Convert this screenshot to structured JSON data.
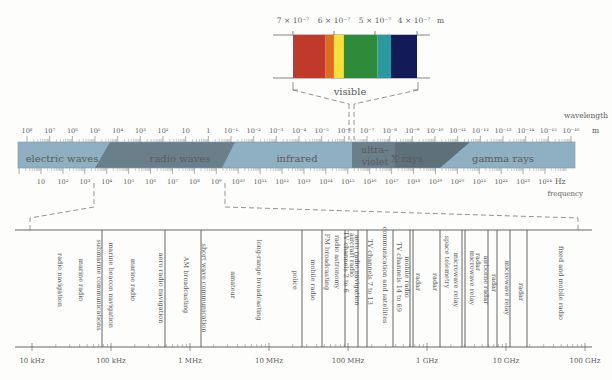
{
  "visible": {
    "title": "visible",
    "wavelength_labels": [
      "7 × 10⁻⁷",
      "6 × 10⁻⁷",
      "5 × 10⁻⁷",
      "4 × 10⁻⁷"
    ],
    "unit": "m",
    "bands": [
      {
        "name": "red",
        "color": "#c0392b",
        "span": 0.26
      },
      {
        "name": "orange",
        "color": "#e06a1e",
        "span": 0.07
      },
      {
        "name": "yellow",
        "color": "#f2e23a",
        "span": 0.08
      },
      {
        "name": "green",
        "color": "#2e8b3a",
        "span": 0.27
      },
      {
        "name": "blue-green",
        "color": "#2a9aa0",
        "span": 0.11
      },
      {
        "name": "violet",
        "color": "#121a58",
        "span": 0.21
      }
    ]
  },
  "spectrum": {
    "wavelength_title": "wavelength",
    "wavelength_unit": "m",
    "wavelength_labels": [
      "10⁸",
      "10⁷",
      "10⁶",
      "10⁵",
      "10⁴",
      "10³",
      "10²",
      "10",
      "1",
      "10⁻¹",
      "10⁻²",
      "10⁻³",
      "10⁻⁴",
      "10⁻⁵",
      "10⁻⁶",
      "10⁻⁷",
      "10⁻⁸",
      "10⁻⁹",
      "10⁻¹⁰",
      "10⁻¹¹",
      "10⁻¹²",
      "10⁻¹³",
      "10⁻¹⁴",
      "10⁻¹⁵",
      "10⁻¹⁶"
    ],
    "frequency_title": "frequency",
    "frequency_unit": "Hz",
    "frequency_labels": [
      "10",
      "10²",
      "10³",
      "10⁴",
      "10⁵",
      "10⁶",
      "10⁷",
      "10⁸",
      "10⁹",
      "10¹⁰",
      "10¹¹",
      "10¹²",
      "10¹³",
      "10¹⁴",
      "10¹⁵",
      "10¹⁶",
      "10¹⁷",
      "10¹⁸",
      "10¹⁹",
      "10²⁰",
      "10²¹",
      "10²²",
      "10²³",
      "10²⁴"
    ],
    "regions": [
      {
        "label": "electric waves"
      },
      {
        "label": "radio waves"
      },
      {
        "label": "infrared"
      },
      {
        "label_line1": "ultra–",
        "label_line2": "violet"
      },
      {
        "label": "X rays"
      },
      {
        "label": "gamma rays"
      }
    ],
    "colors": {
      "light": "#8fb0c3",
      "dark": "#6b7f8b"
    }
  },
  "radio": {
    "axis_labels": [
      "10 kHz",
      "100 kHz",
      "1 MHz",
      "10 MHz",
      "100 MHz",
      "1 GHz",
      "10 GHz",
      "100 GHz"
    ],
    "uses": [
      "radio navigation",
      "marine radio",
      "submarine communications",
      "marine beacon navigation",
      "marine radio",
      "aero radio navigation",
      "AM broadcasting",
      "short wave communication",
      "amateur",
      "long-range broadcasting",
      "police",
      "mobile radio",
      "FM broadcasting",
      "radio astronomy",
      "TV channels 2 to 6",
      "aircraft radio",
      "aero radio navigation",
      "TV channels 7 to 13",
      "communication and satellites",
      "TV channels 14 to 69",
      "mobile radio",
      "radar",
      "space telemetry",
      "microwave relay",
      "radar",
      "microwave relay",
      "radar",
      "airborne radar",
      "radar",
      "microwave relay",
      "radar",
      "fixed and mobile radio"
    ]
  }
}
